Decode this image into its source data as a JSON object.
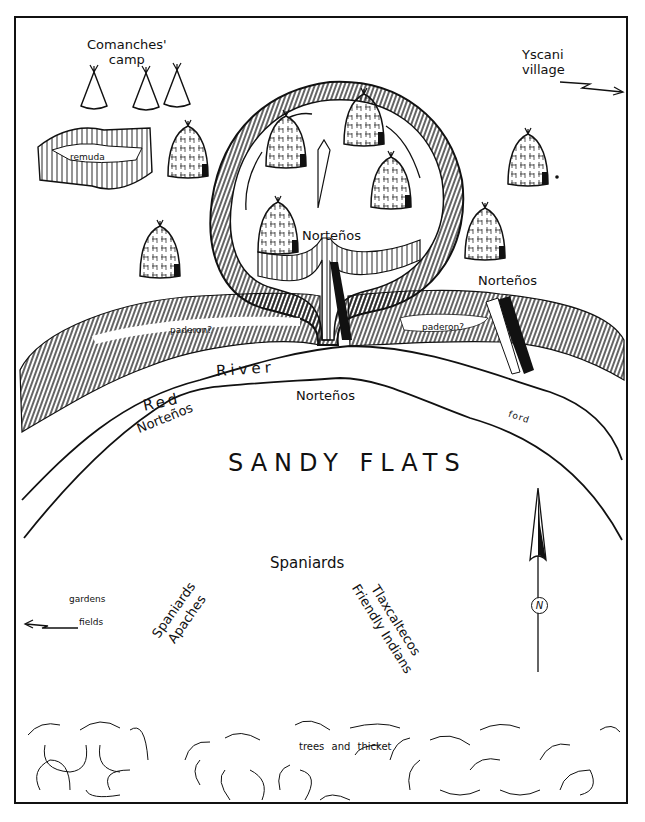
{
  "map": {
    "title_area": "Hand-drawn battle map: Red River encampment",
    "labels": {
      "comanches_camp": [
        "Comanches'",
        "camp"
      ],
      "yscani_village": [
        "Yscani",
        "village"
      ],
      "remuda": "remuda",
      "nortenos_fort": "Norteños",
      "nortenos_east": "Norteños",
      "paderon_west": "paderon?",
      "paderon_east": "paderon?",
      "river_red": "Red",
      "river_river": "River",
      "nortenos_bank_center": "Norteños",
      "nortenos_bank_west": "Norteños",
      "ford": "ford",
      "sandy_flats": "SANDY FLATS",
      "spaniards_center": "Spaniards",
      "spaniards_apaches": [
        "Spaniards",
        "Apaches"
      ],
      "tlaxcaltecos": [
        "Tlaxcaltecos",
        "Friendly Indians"
      ],
      "gardens": "gardens",
      "fields": "fields",
      "trees_and_thicket": "trees and thicket",
      "compass_north": "N"
    },
    "icons": {
      "north_arrow": "north-arrow-icon",
      "tipi": "tipi-icon",
      "grass_hut": "grass-hut-icon",
      "arrow_east": "arrow-right-icon",
      "arrow_west": "arrow-left-icon"
    },
    "colors": {
      "ink": "#111111",
      "paper": "#ffffff"
    }
  }
}
